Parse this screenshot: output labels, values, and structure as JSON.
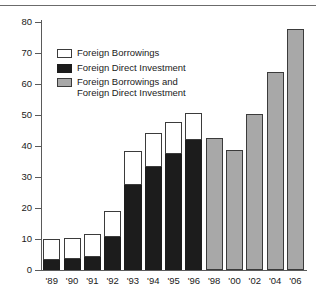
{
  "chart_data": {
    "type": "bar",
    "title": "",
    "subtitle": "",
    "xlabel": "",
    "ylabel": "",
    "stacked": true,
    "grid": false,
    "legend_position": "inside-top-left",
    "ylim": [
      0,
      80
    ],
    "yticks": [
      0,
      10,
      20,
      30,
      40,
      50,
      60,
      70,
      80
    ],
    "ytick_labels": [
      "0",
      "10",
      "20",
      "30",
      "40",
      "50",
      "60",
      "70",
      "80"
    ],
    "categories": [
      "'89",
      "'90",
      "'91",
      "'92",
      "'93",
      "'94",
      "'95",
      "'96",
      "'98",
      "'00",
      "'02",
      "'04",
      "'06"
    ],
    "series": [
      {
        "name": "Foreign Direct Investment",
        "color": "#1c1c1c",
        "values": [
          3.1,
          3.5,
          4.3,
          10.8,
          27.5,
          33.2,
          37.5,
          42.0,
          null,
          null,
          null,
          null,
          null
        ]
      },
      {
        "name": "Foreign Borrowings",
        "color": "#ffffff",
        "values": [
          6.9,
          6.8,
          7.2,
          8.2,
          10.8,
          10.9,
          10.1,
          8.6,
          null,
          null,
          null,
          null,
          null
        ]
      },
      {
        "name": "Foreign Borrowings and Foreign Direct Investment",
        "color": "#a8a8a8",
        "values": [
          null,
          null,
          null,
          null,
          null,
          null,
          null,
          null,
          42.5,
          38.7,
          50.3,
          63.8,
          77.8
        ]
      }
    ],
    "totals": [
      10.0,
      10.3,
      11.5,
      19.0,
      38.3,
      44.1,
      47.6,
      50.6,
      42.5,
      38.7,
      50.3,
      63.8,
      77.8
    ]
  },
  "legend": {
    "items": [
      {
        "label": "Foreign Borrowings",
        "swatch": "white"
      },
      {
        "label": "Foreign Direct Investment",
        "swatch": "black"
      },
      {
        "label": "Foreign Borrowings and\nForeign Direct Investment",
        "swatch": "gray"
      }
    ]
  }
}
